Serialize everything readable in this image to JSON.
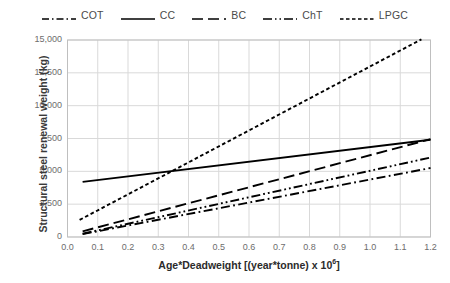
{
  "chart_data": {
    "type": "line",
    "title": "",
    "xlabel": "Age*Deadweight [(year*tonne) x 10⁶]",
    "ylabel": "Structural steel renewal weight (kg)",
    "xlim": [
      0.0,
      1.2
    ],
    "ylim": [
      0,
      15000
    ],
    "xticks": [
      "0.0",
      "0.1",
      "0.2",
      "0.3",
      "0.4",
      "0.5",
      "0.6",
      "0.7",
      "0.8",
      "0.9",
      "1.0",
      "1.1",
      "1.2"
    ],
    "xtick_values": [
      0.0,
      0.1,
      0.2,
      0.3,
      0.4,
      0.5,
      0.6,
      0.7,
      0.8,
      0.9,
      1.0,
      1.1,
      1.2
    ],
    "yticks": [
      "0",
      "2,500",
      "5,000",
      "7,500",
      "10,000",
      "12,500",
      "15,000"
    ],
    "ytick_values": [
      0,
      2500,
      5000,
      7500,
      10000,
      12500,
      15000
    ],
    "grid": true,
    "legend_position": "top",
    "series": [
      {
        "name": "COT",
        "dash_style": "dash-dot",
        "color": "#000000",
        "x": [
          0.05,
          1.2
        ],
        "y": [
          220,
          5250
        ]
      },
      {
        "name": "CC",
        "dash_style": "solid",
        "color": "#000000",
        "x": [
          0.05,
          1.2
        ],
        "y": [
          4200,
          7400
        ]
      },
      {
        "name": "BC",
        "dash_style": "dashed",
        "color": "#000000",
        "x": [
          0.05,
          1.2
        ],
        "y": [
          430,
          7450
        ]
      },
      {
        "name": "ChT",
        "dash_style": "dash-dot-dot",
        "color": "#000000",
        "x": [
          0.05,
          1.2
        ],
        "y": [
          250,
          6050
        ]
      },
      {
        "name": "LPGC",
        "dash_style": "dotted",
        "color": "#000000",
        "x": [
          0.04,
          1.17
        ],
        "y": [
          1300,
          15050
        ]
      }
    ],
    "annotations": [
      {
        "text": "CC and LPGC intersect near x = 0.34, y ≈ 4,700"
      }
    ]
  },
  "legend": {
    "items": [
      {
        "label": "COT",
        "style": "dash-dot"
      },
      {
        "label": "CC",
        "style": "solid"
      },
      {
        "label": "BC",
        "style": "dashed"
      },
      {
        "label": "ChT",
        "style": "dash-dot-dot"
      },
      {
        "label": "LPGC",
        "style": "dotted"
      }
    ]
  },
  "axes": {
    "x_title_main": "Age*Deadweight [(year*tonne) x 10",
    "x_title_sup": "6",
    "x_title_tail": "]",
    "y_title": "Structural steel renewal weight (kg)"
  },
  "colors": {
    "line": "#000000",
    "grid": "#d9d9d9",
    "axis": "#bfbfbf",
    "tick_text": "#6d6d6d",
    "label_text": "#2b2b2b",
    "background": "#ffffff"
  }
}
